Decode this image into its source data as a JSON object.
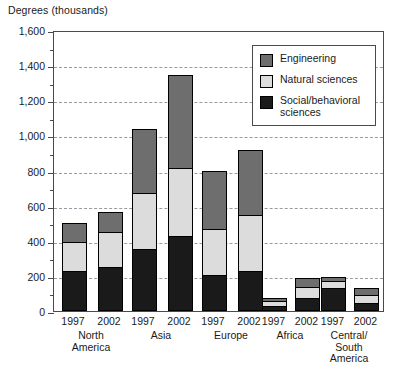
{
  "chart_data": {
    "type": "bar",
    "title": "Degrees (thousands)",
    "subtitle": "",
    "xlabel": "",
    "ylabel": "Degrees (thousands)",
    "ylim": [
      0,
      1600
    ],
    "ytick_step": 200,
    "yminor_step": 100,
    "grid": true,
    "stacked": true,
    "legend_position": "top-right",
    "ytick_labels": [
      "0",
      "200",
      "400",
      "600",
      "800",
      "1,000",
      "1,200",
      "1,400",
      "1,600"
    ],
    "ytick_values": [
      0,
      200,
      400,
      600,
      800,
      1000,
      1200,
      1400,
      1600
    ],
    "groups": [
      "North America",
      "Asia",
      "Europe",
      "Africa",
      "Central/South America"
    ],
    "group_labels": [
      [
        "North",
        "America"
      ],
      [
        "Asia"
      ],
      [
        "Europe"
      ],
      [
        "Africa"
      ],
      [
        "Central/",
        "South",
        "America"
      ]
    ],
    "years": [
      "1997",
      "2002"
    ],
    "categories": [
      "North America 1997",
      "North America 2002",
      "Asia 1997",
      "Asia 2002",
      "Europe 1997",
      "Europe 2002",
      "Africa 1997",
      "Africa 2002",
      "Central/South America 1997",
      "Central/South America 2002"
    ],
    "series": [
      {
        "name": "Social/behavioral sciences",
        "color": "#1a1a1a",
        "values": [
          230,
          250,
          355,
          425,
          205,
          230,
          30,
          75,
          130,
          45
        ]
      },
      {
        "name": "Natural sciences",
        "color": "#dcdcdc",
        "values": [
          170,
          205,
          320,
          395,
          270,
          325,
          30,
          70,
          45,
          50
        ]
      },
      {
        "name": "Engineering",
        "color": "#6e6e6e",
        "values": [
          110,
          120,
          375,
          535,
          335,
          375,
          25,
          55,
          30,
          45
        ]
      }
    ],
    "totals": [
      510,
      575,
      1050,
      1355,
      810,
      930,
      85,
      200,
      205,
      140
    ]
  },
  "legend": {
    "items": [
      {
        "label": "Engineering",
        "color": "#6e6e6e"
      },
      {
        "label": "Natural sciences",
        "color": "#dcdcdc"
      },
      {
        "label": "Social/behavioral sciences",
        "color": "#1a1a1a"
      }
    ]
  }
}
